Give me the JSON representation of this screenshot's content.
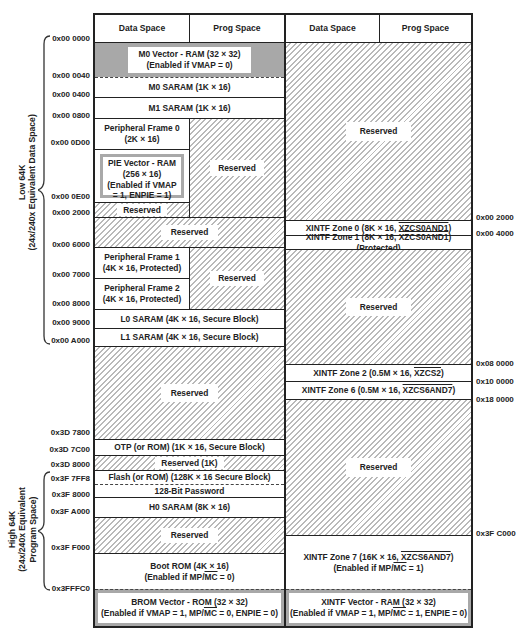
{
  "header": {
    "left_data": "Data Space",
    "left_prog": "Prog Space",
    "right_data": "Data Space",
    "right_prog": "Prog Space"
  },
  "side_labels": {
    "low": {
      "line1": "Low 64K",
      "line2": "(24x/240x Equivalent Data Space)"
    },
    "high": {
      "line1": "High 64K",
      "line2": "(24x/240x Equivalent",
      "line3": "Program Space)"
    }
  },
  "left_addresses": [
    "0x00 0000",
    "0x00 0040",
    "0x00 0400",
    "0x00 0800",
    "0x00 0D00",
    "0x00 0E00",
    "0x00 2000",
    "0x00 6000",
    "0x00 7000",
    "0x00 8000",
    "0x00 9000",
    "0x00 A000",
    "0x3D 7800",
    "0x3D 7C00",
    "0x3D 8000",
    "0x3F 7FF8",
    "0x3F 8000",
    "0x3F A000",
    "0x3F F000",
    "0x3FFFC0"
  ],
  "right_addresses": [
    "0x00 2000",
    "0x00 4000",
    "0x08 0000",
    "0x10 0000",
    "0x18 0000",
    "0x3F C000"
  ],
  "left_blocks": {
    "m0_vector": {
      "line1": "M0 Vector - RAM (32 × 32)",
      "line2": "(Enabled if VMAP = 0)"
    },
    "m0_saram": "M0 SARAM (1K × 16)",
    "m1_saram": "M1 SARAM (1K × 16)",
    "pf0": {
      "line1": "Peripheral Frame 0",
      "line2": "(2K × 16)"
    },
    "pie_vector": {
      "line1": "PIE Vector - RAM",
      "line2": "(256 × 16)",
      "line3": "(Enabled if VMAP",
      "line4": "= 1, ENPIE = 1)"
    },
    "reserved_small": "Reserved",
    "reserved_pf0_prog": "Reserved",
    "reserved_2000": "Reserved",
    "pf1": {
      "line1": "Peripheral Frame 1",
      "line2": "(4K × 16, Protected)"
    },
    "pf2": {
      "line1": "Peripheral Frame 2",
      "line2": "(4K × 16, Protected)"
    },
    "reserved_pf_prog": "Reserved",
    "l0_saram": "L0 SARAM (4K × 16, Secure Block)",
    "l1_saram": "L1 SARAM (4K × 16, Secure Block)",
    "reserved_big": "Reserved",
    "otp": "OTP (or ROM) (1K × 16, Secure Block)",
    "reserved_1k": "Reserved (1K)",
    "flash": "Flash (or ROM) (128K × 16 Secure Block)",
    "password": "128-Bit Password",
    "h0_saram": "H0 SARAM (8K × 16)",
    "reserved_h0": "Reserved",
    "boot_rom": {
      "line1": "Boot ROM (4K × 16)",
      "line2_pre": "(Enabled if MP/",
      "line2_ov": "MC",
      "line2_post": " = 0)"
    },
    "brom_vector": {
      "line1": "BROM Vector - ROM (32 × 32)",
      "line2_pre": "(Enabled if VMAP = 1, MP/",
      "line2_ov": "MC",
      "line2_post": " = 0, ENPIE = 0)"
    }
  },
  "right_blocks": {
    "reserved_top": "Reserved",
    "zone0": {
      "pre": "XINTF Zone 0 (8K × 16, ",
      "ov": "XZCS0AND1",
      "post": ")"
    },
    "zone1": {
      "pre": "XINTF Zone 1 (8K × 16, ",
      "ov": "XZCS0AND1",
      "post": ") (Protected)"
    },
    "reserved_mid": "Reserved",
    "zone2": {
      "pre": "XINTF Zone 2 (0.5M × 16, ",
      "ov": "XZCS2",
      "post": ")"
    },
    "zone6": {
      "pre": "XINTF Zone 6 (0.5M × 16, ",
      "ov": "XZCS6AND7",
      "post": ")"
    },
    "reserved_low": "Reserved",
    "zone7": {
      "pre": "XINTF Zone 7 (16K × 16, ",
      "ov": "XZCS6AND7",
      "post": ")",
      "line2_pre": "(Enabled if MP/",
      "line2_ov": "MC",
      "line2_post": " = 1)"
    },
    "xintf_vector": {
      "line1": "XINTF Vector - RAM (32 × 32)",
      "line2_pre": "(Enabled if VMAP = 1, MP/",
      "line2_ov": "MC",
      "line2_post": " = 1, ENPIE = 0)"
    }
  },
  "colors": {
    "line": "#222222",
    "hatch": "#b9b9b9",
    "grey_fill": "#a8a8a8",
    "background": "#ffffff"
  }
}
